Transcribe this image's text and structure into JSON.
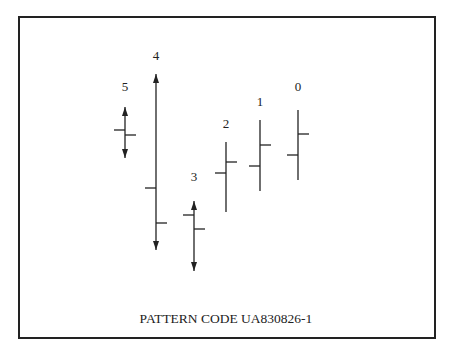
{
  "caption": "PATTERN CODE UA830826-1",
  "colors": {
    "ink": "#222222",
    "background": "#ffffff"
  },
  "chart_data": {
    "type": "ohlc",
    "title": "PATTERN CODE UA830826-1",
    "xlabel": "",
    "ylabel": "",
    "grid": false,
    "legend": "none",
    "note": "Bars labeled right-to-left 0..5; y values in pixel coordinates (smaller = higher). Arrowheads on bars 3, 4, 5 indicate range extends beyond shown ends.",
    "bars": [
      {
        "label": "5",
        "x": 125,
        "high": 107,
        "low": 158,
        "open": 130,
        "close": 135,
        "arrows": true,
        "label_y": 91
      },
      {
        "label": "4",
        "x": 156,
        "high": 74,
        "low": 250,
        "open": 188,
        "close": 223,
        "arrows": true,
        "label_y": 60
      },
      {
        "label": "3",
        "x": 194,
        "high": 201,
        "low": 271,
        "open": 215,
        "close": 229,
        "arrows": true,
        "label_y": 181
      },
      {
        "label": "2",
        "x": 226,
        "high": 142,
        "low": 212,
        "open": 173,
        "close": 162,
        "arrows": false,
        "label_y": 128
      },
      {
        "label": "1",
        "x": 260,
        "high": 120,
        "low": 191,
        "open": 166,
        "close": 145,
        "arrows": false,
        "label_y": 106
      },
      {
        "label": "0",
        "x": 298,
        "high": 110,
        "low": 180,
        "open": 155,
        "close": 134,
        "arrows": false,
        "label_y": 91
      }
    ]
  }
}
